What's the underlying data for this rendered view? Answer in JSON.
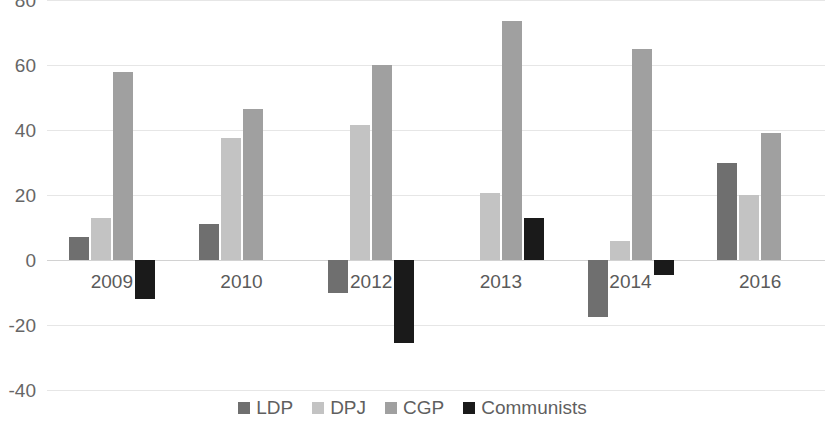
{
  "chart_data": {
    "type": "bar",
    "title": "",
    "subtitle": "",
    "xlabel": "",
    "ylabel": "",
    "categories": [
      "2009",
      "2010",
      "2012",
      "2013",
      "2014",
      "2016"
    ],
    "series": [
      {
        "name": "LDP",
        "color": "#6f6f6f",
        "values": [
          7,
          11,
          -10,
          0,
          -17.5,
          30
        ]
      },
      {
        "name": "DPJ",
        "color": "#c3c3c3",
        "values": [
          13,
          37.5,
          41.5,
          20.5,
          6,
          20
        ]
      },
      {
        "name": "CGP",
        "color": "#a0a0a0",
        "values": [
          58,
          46.5,
          60,
          73.5,
          65,
          39
        ]
      },
      {
        "name": "Communists",
        "color": "#1a1a1a",
        "values": [
          -12,
          0,
          -25.5,
          13,
          -4.5,
          0
        ]
      }
    ],
    "ylim": [
      -40,
      80
    ],
    "yticks": [
      80,
      60,
      40,
      20,
      0,
      -20,
      -40
    ],
    "ytick_labels": [
      "80",
      "60",
      "40",
      "20",
      "0",
      "-20",
      "-40"
    ],
    "grid": true,
    "legend_position": "bottom",
    "zero_line": 0
  },
  "axis": {
    "y_label_color": "#666666",
    "x_label_color": "#5a5a5a",
    "gridline_color": "#e6e6e6",
    "zeroline_color": "#d2d2d2"
  },
  "legend": {
    "entries": [
      {
        "label": "LDP",
        "swatch_name": "legend-swatch-ldp"
      },
      {
        "label": "DPJ",
        "swatch_name": "legend-swatch-dpj"
      },
      {
        "label": "CGP",
        "swatch_name": "legend-swatch-cgp"
      },
      {
        "label": "Communists",
        "swatch_name": "legend-swatch-communists"
      }
    ]
  }
}
